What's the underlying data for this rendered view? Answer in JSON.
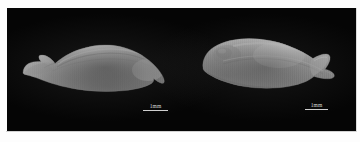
{
  "figure": {
    "type": "scientific-specimen-photograph",
    "caption": "",
    "background_color": "#050505",
    "page_color": "#ffffff",
    "panel": {
      "x": 7,
      "y": 8,
      "width": 349,
      "height": 124
    }
  },
  "specimens": [
    {
      "id": "specimen-left",
      "position": "left",
      "description": "elongated lanceolate grain, ventral view, with hooked basal tail at left and rounded apex at right",
      "outline_color": "#c9c9c9",
      "highlight_color": "#e4e4e4",
      "shadow_color": "#8d8d8d",
      "bounds": {
        "x": 14,
        "y": 28,
        "width": 150,
        "height": 62
      },
      "scale_bar": {
        "label": "1mm",
        "length_px": 25
      }
    },
    {
      "id": "specimen-right",
      "position": "right",
      "description": "plump ovate grain, dorsal view, rounded at left with tapering pointed tip at right",
      "outline_color": "#cccccc",
      "highlight_color": "#eaeaea",
      "shadow_color": "#8a8a8a",
      "bounds": {
        "x": 196,
        "y": 26,
        "width": 140,
        "height": 64
      },
      "scale_bar": {
        "label": "1mm",
        "length_px": 23
      }
    }
  ],
  "scale_bars": {
    "left": {
      "label": "1mm",
      "units": "mm",
      "value": 1
    },
    "right": {
      "label": "1mm",
      "units": "mm",
      "value": 1
    }
  },
  "colors": {
    "plate": "#050505",
    "specimen_light": "#e4e4e4",
    "specimen_mid": "#c2c2c2",
    "specimen_dark": "#8d8d8d",
    "scale_text": "#d8d8d8",
    "paper": "#ffffff"
  }
}
